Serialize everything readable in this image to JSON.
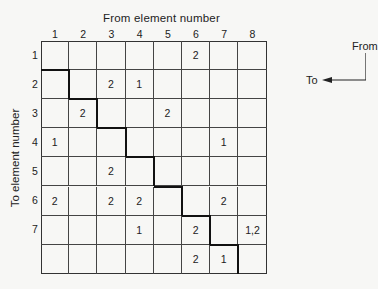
{
  "diagram": {
    "title_top": "From element number",
    "title_left": "To element number",
    "legend": {
      "from_label": "From",
      "to_label": "To",
      "arrow_icon": "elbow-arrow-left"
    },
    "col_labels": [
      "1",
      "2",
      "3",
      "4",
      "5",
      "6",
      "7",
      "8"
    ],
    "row_labels": [
      "1",
      "2",
      "3",
      "4",
      "5",
      "6",
      "7",
      ""
    ],
    "matrix": [
      [
        "",
        "",
        "",
        "",
        "",
        "2",
        "",
        ""
      ],
      [
        "",
        "",
        "2",
        "1",
        "",
        "",
        "",
        ""
      ],
      [
        "",
        "2",
        "",
        "",
        "2",
        "",
        "",
        ""
      ],
      [
        "1",
        "",
        "",
        "",
        "",
        "",
        "1",
        ""
      ],
      [
        "",
        "",
        "2",
        "",
        "",
        "",
        "",
        ""
      ],
      [
        "2",
        "",
        "2",
        "2",
        "",
        "",
        "2",
        ""
      ],
      [
        "",
        "",
        "",
        "1",
        "",
        "2",
        "",
        "1,2"
      ],
      [
        "",
        "",
        "",
        "",
        "",
        "2",
        "1",
        ""
      ]
    ],
    "colors": {
      "line": "#333333",
      "diagonal": "#111111",
      "background": "#f7f7f5"
    }
  }
}
